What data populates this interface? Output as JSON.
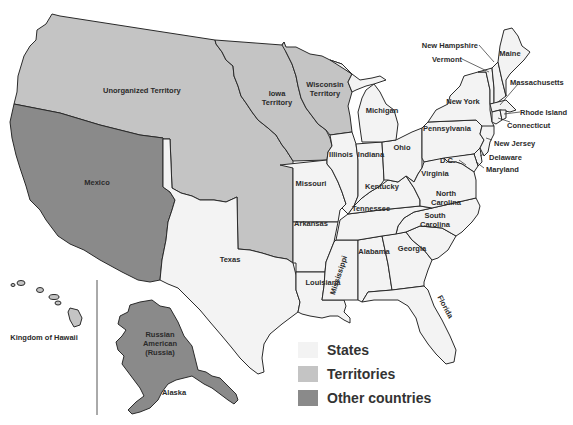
{
  "colors": {
    "states": "#f3f3f3",
    "territories": "#c4c4c4",
    "other_countries": "#8a8a8a",
    "border": "#2a2a2a",
    "background": "#ffffff"
  },
  "regions": {
    "territories": [
      "Unorganized Territory",
      "Iowa Territory",
      "Wisconsin Territory"
    ],
    "other_countries": [
      "Mexico",
      "Russian American (Russia)"
    ],
    "states": [
      "Maine",
      "New Hampshire",
      "Vermont",
      "Massachusetts",
      "Rhode Island",
      "Connecticut",
      "New York",
      "New Jersey",
      "Pennsylvania",
      "Delaware",
      "Maryland",
      "D.C.",
      "Virginia",
      "North Carolina",
      "South Carolina",
      "Georgia",
      "Florida",
      "Alabama",
      "Mississippi",
      "Louisiana",
      "Tennessee",
      "Kentucky",
      "Ohio",
      "Indiana",
      "Illinois",
      "Michigan",
      "Missouri",
      "Arkansas",
      "Texas"
    ]
  },
  "labels": {
    "unorganized": "Unorganized Territory",
    "iowa_1": "Iowa",
    "iowa_2": "Territory",
    "wisconsin_1": "Wisconsin",
    "wisconsin_2": "Territory",
    "mexico": "Mexico",
    "texas": "Texas",
    "michigan": "Michigan",
    "illinois": "Illinois",
    "indiana": "Indiana",
    "ohio": "Ohio",
    "missouri": "Missouri",
    "kentucky": "Kentucky",
    "tennessee": "Tennessee",
    "arkansas": "Arkansas",
    "louisiana": "Louisiana",
    "mississippi": "Mississippi",
    "alabama": "Alabama",
    "georgia": "Georgia",
    "florida": "Florida",
    "south_carolina_1": "South",
    "south_carolina_2": "Carolina",
    "north_carolina_1": "North",
    "north_carolina_2": "Carolina",
    "virginia": "Virginia",
    "pennsylvania": "Pennsylvania",
    "new_york": "New York",
    "new_hampshire": "New Hampshire",
    "vermont": "Vermont",
    "maine": "Maine",
    "massachusetts": "Massachusetts",
    "rhode_island": "Rhode Island",
    "connecticut": "Connecticut",
    "new_jersey": "New Jersey",
    "delaware": "Delaware",
    "maryland": "Maryland",
    "dc": "D.C.",
    "hawaii": "Kingdom of Hawaii",
    "russia_1": "Russian",
    "russia_2": "American",
    "russia_3": "(Russia)",
    "alaska": "Alaska"
  },
  "legend": {
    "items": [
      {
        "label": "States",
        "color": "#f3f3f3"
      },
      {
        "label": "Territories",
        "color": "#c4c4c4"
      },
      {
        "label": "Other countries",
        "color": "#8a8a8a"
      }
    ]
  }
}
